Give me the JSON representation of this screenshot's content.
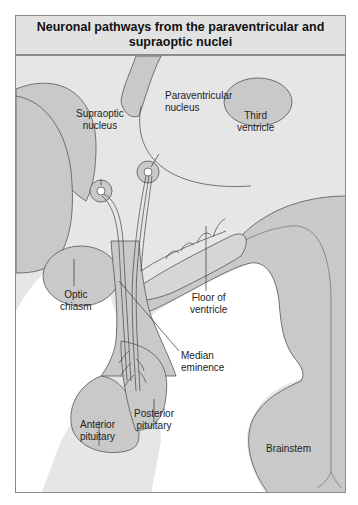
{
  "figure": {
    "title": "Neuronal pathways from the paraventricular and supraoptic nuclei",
    "colors": {
      "background": "#e6e6e6",
      "tissue": "#c9c9c9",
      "outline": "#555555",
      "title_bar": "#e2e2e2",
      "white_space": "#ffffff"
    }
  },
  "labels": {
    "supraoptic_nucleus": "Supraoptic\nnucleus",
    "paraventricular_nucleus": "Paraventricular\nnucleus",
    "third_ventricle": "Third\nventricle",
    "optic_chiasm": "Optic\nchiasm",
    "floor_of_ventricle": "Floor of\nventricle",
    "median_eminence": "Median\neminence",
    "anterior_pituitary": "Anterior\npituitary",
    "posterior_pituitary": "Posterior\npituitary",
    "brainstem": "Brainstem"
  }
}
